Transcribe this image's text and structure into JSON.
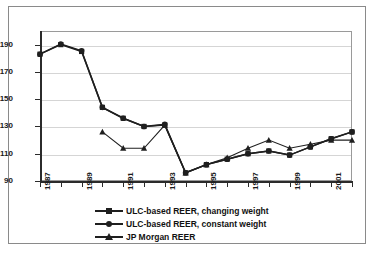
{
  "chart_data": {
    "type": "line",
    "title": "",
    "subtitle": "",
    "xlabel": "",
    "ylabel": "",
    "xlim": [
      1987,
      2002
    ],
    "ylim": [
      90,
      200
    ],
    "yticks": [
      90,
      110,
      130,
      150,
      170,
      190
    ],
    "xticks": [
      1987,
      1988,
      1989,
      1990,
      1991,
      1992,
      1993,
      1994,
      1995,
      1996,
      1997,
      1998,
      1999,
      2000,
      2001,
      2002
    ],
    "xtick_labels": [
      "1987",
      "",
      "1989",
      "",
      "1991",
      "",
      "1993",
      "",
      "1995",
      "",
      "1997",
      "",
      "1999",
      "",
      "2001",
      ""
    ],
    "xtick_labels_shown": [
      "1987",
      "1989",
      "1991",
      "1993",
      "1995",
      "1997",
      "1999",
      "2001"
    ],
    "grid": true,
    "grid_axis": "y",
    "legend_position": "bottom",
    "x": [
      1987,
      1988,
      1989,
      1990,
      1991,
      1992,
      1993,
      1994,
      1995,
      1996,
      1997,
      1998,
      1999,
      2000,
      2001,
      2002
    ],
    "series": [
      {
        "name": "ULC-based REER, changing weight",
        "marker": "square",
        "color": "#1f1f1f",
        "values": [
          183,
          190,
          185,
          144,
          136,
          130,
          131,
          96,
          102,
          106,
          110,
          112,
          109,
          115,
          121,
          126
        ]
      },
      {
        "name": "ULC-based REER, constant weight",
        "marker": "circle",
        "color": "#1f1f1f",
        "values": [
          183,
          190.5,
          185.5,
          144,
          136,
          130,
          131.5,
          96,
          102,
          106,
          110,
          112,
          109,
          115,
          121,
          126
        ]
      },
      {
        "name": "JP Morgan REER",
        "marker": "triangle",
        "color": "#1f1f1f",
        "values": [
          null,
          null,
          null,
          126,
          114,
          114,
          131,
          96,
          102,
          107,
          114,
          120,
          114,
          117,
          120,
          120
        ]
      }
    ]
  },
  "legend": {
    "items": [
      {
        "label": "ULC-based REER, changing weight",
        "marker": "square"
      },
      {
        "label": "ULC-based REER, constant weight",
        "marker": "circle"
      },
      {
        "label": "JP Morgan REER",
        "marker": "triangle"
      }
    ]
  },
  "colors": {
    "series": "#1f1f1f",
    "grid": "#d5d5d5",
    "axis": "#2b2b2b",
    "frame": "#8a8a8a",
    "background": "#ffffff"
  }
}
